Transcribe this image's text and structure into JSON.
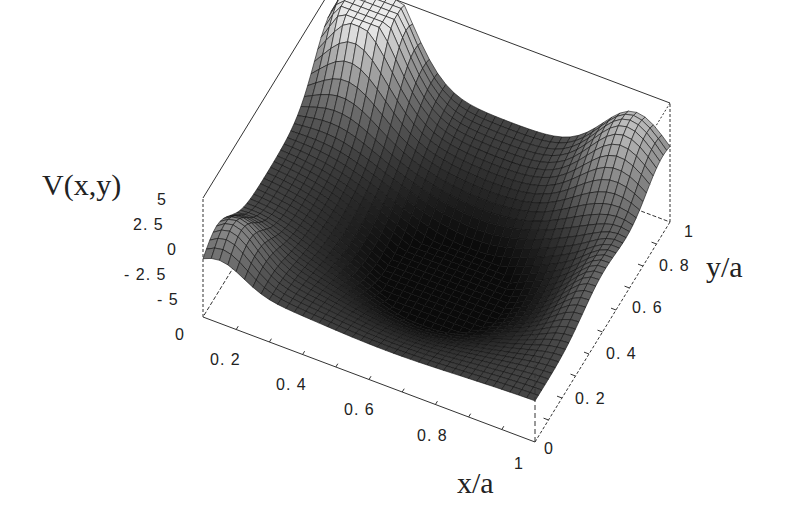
{
  "chart_data": {
    "type": "surface3d",
    "title": "",
    "zlabel": "V(x,y)",
    "xlabel": "x/a",
    "ylabel": "y/a",
    "z_ticks": [
      "5",
      "2. 5",
      "0",
      "- 2. 5",
      "- 5"
    ],
    "x_ticks": [
      "0",
      "0. 2",
      "0. 4",
      "0. 6",
      "0. 8",
      "1"
    ],
    "y_ticks": [
      "0",
      "0. 2",
      "0. 4",
      "0. 6",
      "0. 8",
      "1"
    ],
    "xlim": [
      0,
      1
    ],
    "ylim": [
      0,
      1
    ],
    "zlim": [
      -5,
      5
    ],
    "grid": false,
    "legend": null
  },
  "labels": {
    "z_axis_title": "V(x,y)",
    "x_axis_title": "x/a",
    "y_axis_title": "y/a",
    "z_tick_0": "5",
    "z_tick_1": "2. 5",
    "z_tick_2": "0",
    "z_tick_3": "- 2. 5",
    "z_tick_4": "- 5",
    "x_tick_0": "0",
    "x_tick_1": "0. 2",
    "x_tick_2": "0. 4",
    "x_tick_3": "0. 6",
    "x_tick_4": "0. 8",
    "x_tick_5": "1",
    "y_tick_0": "0",
    "y_tick_1": "0. 2",
    "y_tick_2": "0. 4",
    "y_tick_3": "0. 6",
    "y_tick_4": "0. 8",
    "y_tick_5": "1"
  }
}
